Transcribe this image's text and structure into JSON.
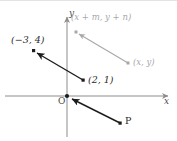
{
  "figure": {
    "kind": "coordinate-plane-vector-diagram",
    "width": 177,
    "height": 141,
    "background_color": "#ffffff",
    "top_border_color": "#e3e3e3"
  },
  "axes": {
    "x_label": "x",
    "y_label": "y",
    "origin_label": "O",
    "axis_color": "#8c8c8c",
    "origin_pixel": {
      "x": 67,
      "y": 95
    },
    "x_axis_from_pixel": {
      "x": 5,
      "y": 95
    },
    "x_axis_to_pixel": {
      "x": 170,
      "y": 95
    },
    "y_axis_from_pixel": {
      "x": 67,
      "y": 136
    },
    "y_axis_to_pixel": {
      "x": 67,
      "y": 14
    },
    "grid": false,
    "tick_labels": []
  },
  "labels": {
    "point_a": "(−3, 4)",
    "point_b": "(2, 1)",
    "point_p": "P",
    "translated_head": "(x + m, y + n)",
    "translated_tail": "(x, y)"
  },
  "colors": {
    "black_vector": "#1c1c1c",
    "gray_vector": "#a8a8ac",
    "point_black": "#1c1c1c",
    "point_gray": "#a8a8ac",
    "text_black": "#2b2b2b",
    "text_gray": "#a8a8ac",
    "axis": "#8c8c8c"
  },
  "vectors": [
    {
      "name": "black-vector-main",
      "color": "#1c1c1c",
      "tail_pixel": {
        "x": 83,
        "y": 79
      },
      "head_pixel": {
        "x": 34,
        "y": 50
      },
      "tail_label": "(2, 1)",
      "head_label": "(−3, 4)",
      "arrowhead_at": "head"
    },
    {
      "name": "gray-vector-translated",
      "color": "#a8a8ac",
      "tail_pixel": {
        "x": 128,
        "y": 62
      },
      "head_pixel": {
        "x": 76,
        "y": 31
      },
      "tail_label": "(x, y)",
      "head_label": "(x + m, y + n)",
      "arrowhead_at": "head"
    },
    {
      "name": "black-vector-from-p",
      "color": "#1c1c1c",
      "tail_pixel": {
        "x": 120,
        "y": 122
      },
      "head_pixel": {
        "x": 70,
        "y": 97
      },
      "tail_label": "P",
      "head_label": "O",
      "arrowhead_at": "head"
    }
  ],
  "points": [
    {
      "name": "point-neg3-4",
      "pixel": {
        "x": 34,
        "y": 50
      },
      "color": "#1c1c1c",
      "label": "(−3, 4)"
    },
    {
      "name": "point-2-1",
      "pixel": {
        "x": 83,
        "y": 79
      },
      "color": "#1c1c1c",
      "label": "(2, 1)"
    },
    {
      "name": "point-origin",
      "pixel": {
        "x": 67,
        "y": 95
      },
      "color": "#1c1c1c",
      "label": "O"
    },
    {
      "name": "point-p",
      "pixel": {
        "x": 120,
        "y": 122
      },
      "color": "#1c1c1c",
      "label": "P"
    },
    {
      "name": "point-xmyn",
      "pixel": {
        "x": 76,
        "y": 31
      },
      "color": "#a8a8ac",
      "label": "(x + m, y + n)"
    },
    {
      "name": "point-xy",
      "pixel": {
        "x": 128,
        "y": 62
      },
      "color": "#a8a8ac",
      "label": "(x, y)"
    }
  ]
}
